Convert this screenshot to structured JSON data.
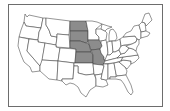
{
  "map": {
    "title": "United States",
    "highlight_color": "#8c8c8c",
    "base_color": "#ffffff",
    "border_color": "#3e3e3e",
    "frame_color": "#6d6d6d",
    "highlighted_states": [
      "North Dakota",
      "South Dakota",
      "Nebraska",
      "Kansas",
      "Iowa",
      "Missouri"
    ],
    "states": [
      {
        "id": "WA",
        "name": "Washington",
        "highlighted": false
      },
      {
        "id": "OR",
        "name": "Oregon",
        "highlighted": false
      },
      {
        "id": "CA",
        "name": "California",
        "highlighted": false
      },
      {
        "id": "ID",
        "name": "Idaho",
        "highlighted": false
      },
      {
        "id": "NV",
        "name": "Nevada",
        "highlighted": false
      },
      {
        "id": "MT",
        "name": "Montana",
        "highlighted": false
      },
      {
        "id": "WY",
        "name": "Wyoming",
        "highlighted": false
      },
      {
        "id": "UT",
        "name": "Utah",
        "highlighted": false
      },
      {
        "id": "AZ",
        "name": "Arizona",
        "highlighted": false
      },
      {
        "id": "CO",
        "name": "Colorado",
        "highlighted": false
      },
      {
        "id": "NM",
        "name": "New Mexico",
        "highlighted": false
      },
      {
        "id": "ND",
        "name": "North Dakota",
        "highlighted": true
      },
      {
        "id": "SD",
        "name": "South Dakota",
        "highlighted": true
      },
      {
        "id": "NE",
        "name": "Nebraska",
        "highlighted": true
      },
      {
        "id": "KS",
        "name": "Kansas",
        "highlighted": true
      },
      {
        "id": "OK",
        "name": "Oklahoma",
        "highlighted": false
      },
      {
        "id": "TX",
        "name": "Texas",
        "highlighted": false
      },
      {
        "id": "MN",
        "name": "Minnesota",
        "highlighted": false
      },
      {
        "id": "IA",
        "name": "Iowa",
        "highlighted": true
      },
      {
        "id": "MO",
        "name": "Missouri",
        "highlighted": true
      },
      {
        "id": "AR",
        "name": "Arkansas",
        "highlighted": false
      },
      {
        "id": "LA",
        "name": "Louisiana",
        "highlighted": false
      },
      {
        "id": "WI",
        "name": "Wisconsin",
        "highlighted": false
      },
      {
        "id": "IL",
        "name": "Illinois",
        "highlighted": false
      },
      {
        "id": "MI",
        "name": "Michigan",
        "highlighted": false
      },
      {
        "id": "IN",
        "name": "Indiana",
        "highlighted": false
      },
      {
        "id": "OH",
        "name": "Ohio",
        "highlighted": false
      },
      {
        "id": "KY",
        "name": "Kentucky",
        "highlighted": false
      },
      {
        "id": "TN",
        "name": "Tennessee",
        "highlighted": false
      },
      {
        "id": "MS",
        "name": "Mississippi",
        "highlighted": false
      },
      {
        "id": "AL",
        "name": "Alabama",
        "highlighted": false
      },
      {
        "id": "GA",
        "name": "Georgia",
        "highlighted": false
      },
      {
        "id": "FL",
        "name": "Florida",
        "highlighted": false
      },
      {
        "id": "SC",
        "name": "South Carolina",
        "highlighted": false
      },
      {
        "id": "NC",
        "name": "North Carolina",
        "highlighted": false
      },
      {
        "id": "VA",
        "name": "Virginia",
        "highlighted": false
      },
      {
        "id": "WV",
        "name": "West Virginia",
        "highlighted": false
      },
      {
        "id": "PA",
        "name": "Pennsylvania",
        "highlighted": false
      },
      {
        "id": "NY",
        "name": "New York",
        "highlighted": false
      },
      {
        "id": "NE_REGION",
        "name": "New England",
        "highlighted": false
      },
      {
        "id": "MD_DE_NJ",
        "name": "Mid-Atlantic coast",
        "highlighted": false
      }
    ]
  }
}
